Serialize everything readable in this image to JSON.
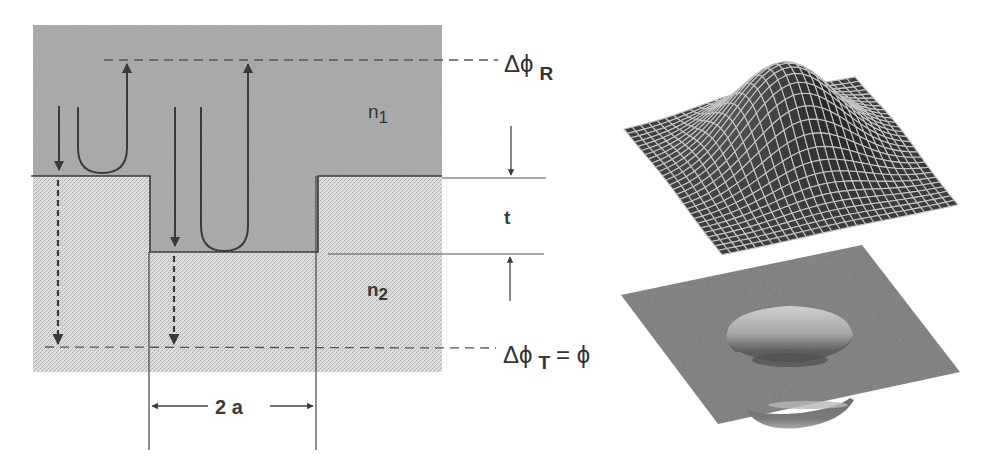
{
  "diagram": {
    "type": "cross-section-with-3d-surfaces",
    "colors": {
      "upper_medium": "#a4a4a4",
      "lower_medium": "#d2d2d2",
      "lines": "#3a3a3a",
      "dashed": "#555555",
      "mesh_fill": "#3e3e3e",
      "mesh_lines": "#bdbdbd",
      "plate": "#7a7a7a"
    },
    "labels": {
      "n1": "n",
      "n1_sub": "1",
      "n2": "n",
      "n2_sub": "2",
      "t": "t",
      "width": "2 a",
      "delta_phi_R": "Δϕ",
      "delta_phi_R_sub": "R",
      "delta_phi_T": "Δϕ",
      "delta_phi_T_sub": "T",
      "delta_phi_T_eq": "= ϕ"
    },
    "regions": [
      {
        "name": "upper-medium",
        "label": "n1"
      },
      {
        "name": "lower-medium",
        "label": "n2"
      },
      {
        "name": "pit",
        "depth_label": "t",
        "width_label": "2 a"
      }
    ],
    "rays": [
      {
        "name": "incident-ray-left",
        "direction": "down",
        "style": "solid",
        "continues": "dashed transmitted"
      },
      {
        "name": "reflected-loop-top",
        "shape": "U-turn",
        "reflects_at": "top surface"
      },
      {
        "name": "incident-ray-pit",
        "direction": "down",
        "style": "solid",
        "continues": "dashed transmitted"
      },
      {
        "name": "reflected-loop-pit",
        "shape": "U-turn",
        "reflects_at": "pit bottom"
      }
    ],
    "reference_lines": [
      {
        "name": "reflected-phase-reference",
        "label": "ΔϕR"
      },
      {
        "name": "transmitted-phase-reference",
        "label": "ΔϕT = ϕ"
      }
    ],
    "surfaces": [
      {
        "name": "mesh-surface",
        "description": "Wire-mesh Gaussian bump"
      },
      {
        "name": "plate-surface",
        "description": "Flat plate with circular cylindrical dimple"
      }
    ]
  }
}
